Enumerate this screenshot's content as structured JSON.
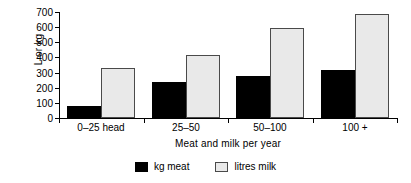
{
  "chart_data": {
    "type": "bar",
    "title": "",
    "xlabel": "Meat and milk per year",
    "ylabel": "L or kg",
    "categories": [
      "0–25 head",
      "25–50",
      "50–100",
      "100 +"
    ],
    "series": [
      {
        "name": "kg meat",
        "color": "#000000",
        "values": [
          80,
          240,
          280,
          315
        ]
      },
      {
        "name": "litres milk",
        "color": "#e9e9e9",
        "values": [
          327,
          415,
          595,
          685
        ]
      }
    ],
    "ylim": [
      0,
      700
    ],
    "ytick_values": [
      0,
      100,
      200,
      300,
      400,
      500,
      600,
      700
    ],
    "ytick_labels": [
      "0",
      "100",
      "200",
      "300",
      "400",
      "500",
      "600",
      "700"
    ],
    "grid": false,
    "legend_position": "bottom"
  },
  "axes": {
    "y_title": "L or kg",
    "x_title": "Meat and milk per year"
  },
  "legend": {
    "items": [
      {
        "label": "kg meat",
        "swatch": "black-square-icon"
      },
      {
        "label": "litres milk",
        "swatch": "gray-square-icon"
      }
    ]
  }
}
